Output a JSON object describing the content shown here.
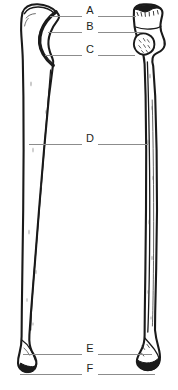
{
  "figure": {
    "background_color": "#ffffff",
    "ink_color": "#1a1a1a",
    "leader_line_color": "#8c8c8c",
    "label_color": "#231f20",
    "width": 178,
    "height": 390,
    "bones": [
      {
        "id": "left-bone",
        "name": "ulna",
        "position": "left",
        "orientation": "vertical",
        "proximal_feature": "olecranon and trochlear notch",
        "distal_feature": "head and styloid process"
      },
      {
        "id": "right-bone",
        "name": "radius",
        "position": "right",
        "orientation": "vertical",
        "proximal_feature": "head, neck and tuberosity",
        "distal_feature": "distal end and styloid process"
      }
    ],
    "labels": [
      {
        "key": "A",
        "text": "A",
        "label_x": 90,
        "label_y": 11,
        "line_y": 16,
        "line_left_start": 50,
        "line_left_end": 82,
        "line_right_start": 98,
        "line_right_end": 136
      },
      {
        "key": "B",
        "text": "B",
        "label_x": 90,
        "label_y": 27,
        "line_y": 32,
        "line_left_start": 48,
        "line_left_end": 82,
        "line_right_start": 98,
        "line_right_end": 143
      },
      {
        "key": "C",
        "text": "C",
        "label_x": 90,
        "label_y": 50,
        "line_y": 55,
        "line_left_start": 45,
        "line_left_end": 82,
        "line_right_start": 98,
        "line_right_end": 135
      },
      {
        "key": "D",
        "text": "D",
        "label_x": 90,
        "label_y": 139,
        "line_y": 144,
        "line_left_start": 29,
        "line_left_end": 82,
        "line_right_start": 98,
        "line_right_end": 148
      },
      {
        "key": "E",
        "text": "E",
        "label_x": 90,
        "label_y": 349,
        "line_y": 354,
        "line_left_start": 23,
        "line_left_end": 82,
        "line_right_start": 98,
        "line_right_end": 152
      },
      {
        "key": "F",
        "text": "F",
        "label_x": 90,
        "label_y": 369,
        "line_y": 374,
        "line_left_start": 20,
        "line_left_end": 82,
        "line_right_start": 98,
        "line_right_end": 155
      }
    ]
  }
}
